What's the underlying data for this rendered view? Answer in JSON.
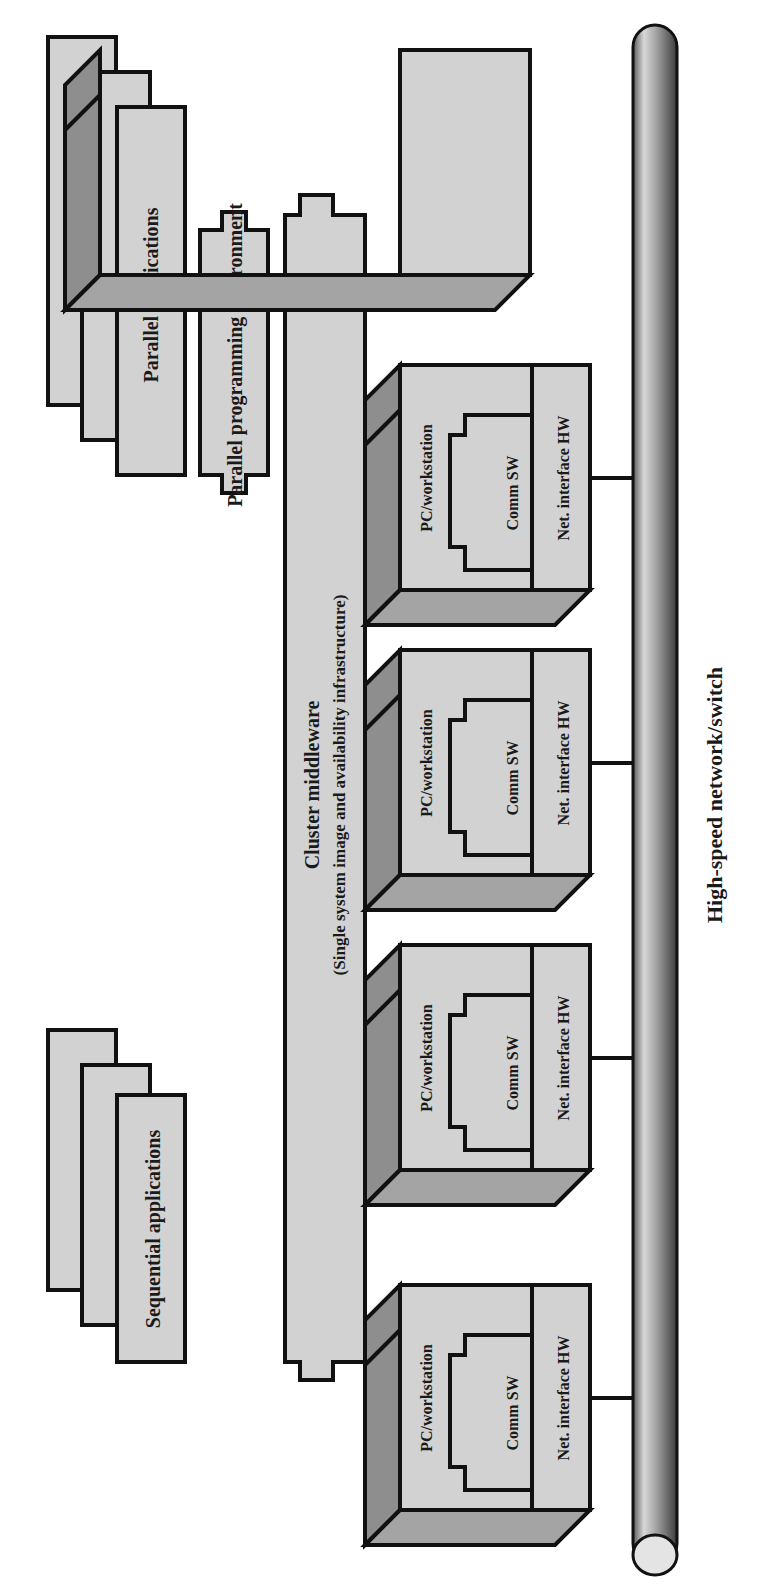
{
  "diagram": {
    "orientation": "rotated-90-ccw",
    "colors": {
      "box_fill": "#d2d2d2",
      "box_dark": "#8e8e8e",
      "box_top": "#a4a4a4",
      "stroke": "#111111",
      "background": "#ffffff"
    },
    "sequential_applications": {
      "label": "Sequential applications",
      "stack_count": 3
    },
    "parallel_applications": {
      "label": "Parallel applications",
      "stack_count": 3
    },
    "parallel_programming_environment": {
      "label": "Parallel programming environment"
    },
    "cluster_middleware": {
      "title": "Cluster middleware",
      "subtitle": "(Single system image and availability infrastructure)"
    },
    "nodes": [
      {
        "pc_label": "PC/workstation",
        "comm_label": "Comm SW",
        "nic_label": "Net. interface HW"
      },
      {
        "pc_label": "PC/workstation",
        "comm_label": "Comm SW",
        "nic_label": "Net. interface HW"
      },
      {
        "pc_label": "PC/workstation",
        "comm_label": "Comm SW",
        "nic_label": "Net. interface HW"
      },
      {
        "pc_label": "PC/workstation",
        "comm_label": "Comm SW",
        "nic_label": "Net. interface HW"
      },
      {
        "pc_label": "PC/workstation",
        "comm_label": "Comm SW",
        "nic_label": "Net. interface HW"
      }
    ],
    "network": {
      "label": "High-speed network/switch"
    }
  }
}
